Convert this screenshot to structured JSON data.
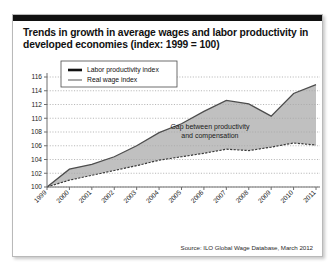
{
  "figure": {
    "title": "Trends in growth in average wages and labor productivity in developed economies (index: 1999 = 100)",
    "source": "Source: ILO Global Wage Database, March 2012",
    "annotation_line1": "Gap between productivity",
    "annotation_line2": "and compensation"
  },
  "chart_data": {
    "type": "line",
    "title": "Trends in growth in average wages and labor productivity in developed economies (index: 1999 = 100)",
    "xlabel": "",
    "ylabel": "",
    "ylim": [
      100,
      116
    ],
    "yticks": [
      100,
      102,
      104,
      106,
      108,
      110,
      112,
      114,
      116
    ],
    "grid": true,
    "legend_position": "top-left",
    "categories": [
      "1999",
      "2000",
      "2001",
      "2002",
      "2003",
      "2004",
      "2005",
      "2006",
      "2007",
      "2008",
      "2009",
      "2010",
      "2011"
    ],
    "series": [
      {
        "name": "Labor productivity index",
        "color": "#111111",
        "values": [
          100.0,
          102.6,
          103.3,
          104.4,
          106.0,
          107.9,
          109.2,
          111.0,
          112.6,
          112.1,
          110.3,
          113.6,
          114.9
        ]
      },
      {
        "name": "Real wage index",
        "color": "#8e8e8e",
        "values": [
          100.0,
          101.0,
          101.7,
          102.4,
          103.1,
          103.9,
          104.4,
          104.9,
          105.5,
          105.3,
          105.8,
          106.4,
          106.1
        ]
      }
    ],
    "annotations": [
      {
        "text": "Gap between productivity and compensation",
        "x": "2006",
        "y": 108.5
      }
    ]
  },
  "colors": {
    "gap_fill": "#a8a8a8",
    "panel_border": "#b9b9b9",
    "top_bar": "#111111"
  }
}
